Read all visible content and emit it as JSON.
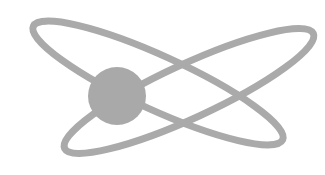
{
  "figure": {
    "colors": {
      "background": "#ffffff",
      "stroke": "#aaaaaa",
      "nucleus": "#a9a9a9"
    },
    "orbits": [
      {
        "cx": 158,
        "cy": 83,
        "rx": 137,
        "ry": 27,
        "rotate": 24.5
      },
      {
        "cx": 189,
        "cy": 91,
        "rx": 137,
        "ry": 27,
        "rotate": -24.8
      }
    ],
    "nucleus": {
      "cx": 117,
      "cy": 96,
      "r": 29
    }
  }
}
